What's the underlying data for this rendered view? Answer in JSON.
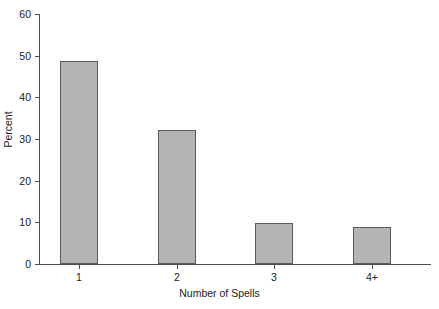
{
  "chart_data": {
    "type": "bar",
    "title": "",
    "subtitle": "",
    "xlabel": "Number of Spells",
    "ylabel": "Percent",
    "categories": [
      "1",
      "2",
      "3",
      "4+"
    ],
    "values": [
      48.7,
      32.2,
      9.8,
      8.9
    ],
    "ylim": [
      0,
      60
    ],
    "yticks": [
      0,
      10,
      20,
      30,
      40,
      50,
      60
    ],
    "ytick_labels": [
      "0",
      "10",
      "20",
      "30",
      "40",
      "50",
      "60"
    ],
    "grid": false,
    "legend": false,
    "legend_position": "none",
    "bar_fill_color": "#b4b4b4",
    "bar_edge_color": "#5a5a5a",
    "axis_color": "#4d4d4d",
    "background_color": "#ffffff"
  }
}
